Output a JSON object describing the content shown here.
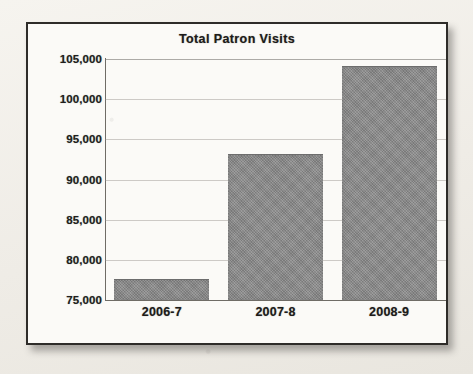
{
  "chart_data": {
    "type": "bar",
    "title": "Total Patron Visits",
    "xlabel": "",
    "ylabel": "",
    "categories": [
      "2006-7",
      "2007-8",
      "2008-9"
    ],
    "values": [
      77500,
      93000,
      104000
    ],
    "ylim": [
      75000,
      105000
    ],
    "ytick_values": [
      75000,
      80000,
      85000,
      90000,
      95000,
      100000,
      105000
    ],
    "ytick_labels": [
      "75,000",
      "80,000",
      "85,000",
      "90,000",
      "95,000",
      "100,000",
      "105,000"
    ],
    "grid": true,
    "legend": false,
    "bar_color": "#8a8a8a",
    "plot_background": "#fbfaf7",
    "frame_color": "#2e2c29"
  },
  "frame": {
    "shadow_color": "#3c3a36"
  }
}
